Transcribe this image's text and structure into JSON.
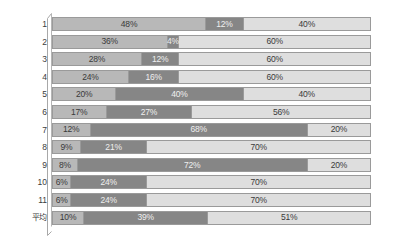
{
  "chart_data": {
    "type": "bar",
    "subtype": "stacked-horizontal-100-percent",
    "title": "",
    "xlabel": "",
    "ylabel": "",
    "xlim": [
      0,
      100
    ],
    "grid": false,
    "legend": null,
    "value_suffix": "%",
    "categories": [
      "1",
      "2",
      "3",
      "4",
      "5",
      "6",
      "7",
      "8",
      "9",
      "10",
      "11",
      "平均"
    ],
    "series": [
      {
        "name": "series-1",
        "color": "#b8b8b8",
        "values": [
          48,
          36,
          28,
          24,
          20,
          17,
          12,
          9,
          8,
          6,
          6,
          10
        ]
      },
      {
        "name": "series-2",
        "color": "#868686",
        "values": [
          12,
          4,
          12,
          16,
          40,
          27,
          68,
          21,
          72,
          24,
          24,
          39
        ]
      },
      {
        "name": "series-3",
        "color": "#dedede",
        "values": [
          40,
          60,
          60,
          60,
          40,
          56,
          20,
          70,
          20,
          70,
          70,
          51
        ]
      }
    ],
    "labels": [
      [
        "48%",
        "12%",
        "40%"
      ],
      [
        "36%",
        "4%",
        "60%"
      ],
      [
        "28%",
        "12%",
        "60%"
      ],
      [
        "24%",
        "16%",
        "60%"
      ],
      [
        "20%",
        "40%",
        "40%"
      ],
      [
        "17%",
        "27%",
        "56%"
      ],
      [
        "12%",
        "68%",
        "20%"
      ],
      [
        "9%",
        "21%",
        "70%"
      ],
      [
        "8%",
        "72%",
        "20%"
      ],
      [
        "6%",
        "24%",
        "70%"
      ],
      [
        "6%",
        "24%",
        "70%"
      ],
      [
        "10%",
        "39%",
        "51%"
      ]
    ]
  },
  "colors": {
    "series_1": "#b8b8b8",
    "series_2": "#868686",
    "series_3": "#dedede",
    "segment_border": "#9a9a9a",
    "axis": "#a0a0a0",
    "label_text": "#3b3b3b",
    "background": "#ffffff"
  }
}
